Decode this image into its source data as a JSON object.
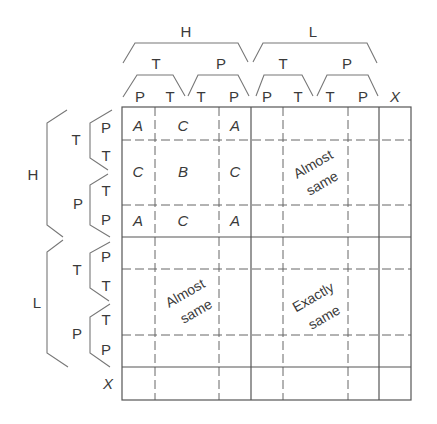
{
  "columns": {
    "level1": [
      {
        "label": "H"
      },
      {
        "label": "L"
      }
    ],
    "level2": [
      {
        "label": "T"
      },
      {
        "label": "P"
      },
      {
        "label": "T"
      },
      {
        "label": "P"
      }
    ],
    "level3": [
      "P",
      "T",
      "T",
      "P",
      "P",
      "T",
      "T",
      "P",
      "X"
    ]
  },
  "rows": {
    "level1": [
      {
        "label": "H"
      },
      {
        "label": "L"
      }
    ],
    "level2": [
      {
        "label": "T"
      },
      {
        "label": "P"
      },
      {
        "label": "T"
      },
      {
        "label": "P"
      }
    ],
    "level3": [
      "P",
      "T",
      "T",
      "P",
      "P",
      "T",
      "T",
      "P",
      "X"
    ]
  },
  "cells": {
    "HH": [
      [
        "A",
        "C",
        "A"
      ],
      [
        "C",
        "B",
        "C"
      ],
      [
        "A",
        "C",
        "A"
      ]
    ]
  },
  "regions": {
    "HL": {
      "line1": "Almost",
      "line2": "same"
    },
    "LH": {
      "line1": "Almost",
      "line2": "same"
    },
    "LL": {
      "line1": "Exactly",
      "line2": "same"
    }
  },
  "colors": {
    "grid_line": "#555555",
    "bracket_line": "#777777",
    "text": "#3a3a3a",
    "background": "#ffffff"
  }
}
